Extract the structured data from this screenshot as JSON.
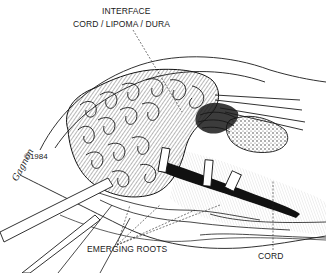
{
  "figure": {
    "labels": {
      "interface_line1": "INTERFACE",
      "interface_line2": "CORD / LIPOMA / DURA",
      "emerging_roots": "EMERGING ROOTS",
      "cord": "CORD"
    },
    "signature": "Gagnon",
    "copyright": "©1984"
  },
  "colors": {
    "ink": "#1a1a1a",
    "background": "#ffffff"
  }
}
